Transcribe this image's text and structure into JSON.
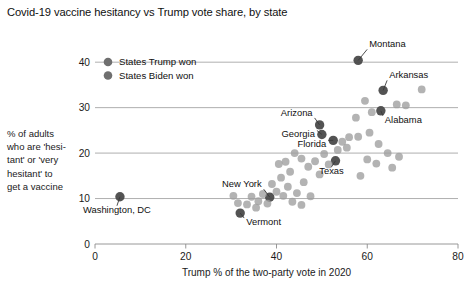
{
  "chart_data": {
    "type": "scatter",
    "title": "Covid-19 vaccine hesitancy vs Trump vote share, by state",
    "xlabel": "Trump % of the two-party vote in 2020",
    "ylabel": "% of adults who are 'hesitant' or 'very hesitant' to get a vaccine",
    "ylabel_lines": [
      "% of adults",
      "who are 'hesi-",
      "tant' or 'very",
      "hesitant' to",
      "get a vaccine"
    ],
    "xlim": [
      0,
      80
    ],
    "ylim": [
      0,
      44
    ],
    "xticks": [
      0,
      20,
      40,
      60,
      80
    ],
    "yticks": [
      0,
      10,
      20,
      30,
      40
    ],
    "xtick_labels": [
      "0",
      "20",
      "40",
      "60",
      "80"
    ],
    "ytick_labels": [
      "0",
      "10",
      "20",
      "30",
      "40"
    ],
    "grid": "horizontal",
    "legend_position": "top-left-inside",
    "colors": {
      "trump_won": "#6f6f6f",
      "biden_won": "#6f6f6f",
      "highlight": "#4a4a4a",
      "plain": "#9e9e9e",
      "gridline": "#9a9a9a",
      "text": "#101010"
    },
    "legend": [
      {
        "label": "States Trump won",
        "color": "#6f6f6f",
        "key": "trump_won"
      },
      {
        "label": "States Biden won",
        "color": "#6f6f6f",
        "key": "biden_won"
      }
    ],
    "series": [
      {
        "name": "States Trump won",
        "key": "trump_won",
        "points": [
          {
            "label": "Montana",
            "x": 58.0,
            "y": 40.4,
            "highlight": true,
            "label_dx": 11,
            "label_dy": -13,
            "anchor": "start"
          },
          {
            "label": "Arkansas",
            "x": 63.5,
            "y": 33.8,
            "highlight": true,
            "label_dx": 6,
            "label_dy": -12,
            "anchor": "start"
          },
          {
            "label": "Alabama",
            "x": 63.0,
            "y": 29.3,
            "highlight": true,
            "label_dx": 4,
            "label_dy": 12,
            "anchor": "start"
          },
          {
            "label": "Florida",
            "x": 52.5,
            "y": 22.8,
            "highlight": true,
            "label_dx": -7,
            "label_dy": 7,
            "anchor": "end"
          },
          {
            "label": "Texas",
            "x": 53.0,
            "y": 18.3,
            "highlight": true,
            "label_dx": -4,
            "label_dy": 13,
            "anchor": "middle"
          },
          {
            "label": null,
            "x": 72.0,
            "y": 34.0,
            "highlight": false
          },
          {
            "label": null,
            "x": 68.5,
            "y": 30.5,
            "highlight": false
          },
          {
            "label": null,
            "x": 66.5,
            "y": 30.7,
            "highlight": false
          },
          {
            "label": null,
            "x": 59.5,
            "y": 31.5,
            "highlight": false
          },
          {
            "label": null,
            "x": 61.0,
            "y": 29.0,
            "highlight": false
          },
          {
            "label": null,
            "x": 57.5,
            "y": 27.8,
            "highlight": false
          },
          {
            "label": null,
            "x": 60.5,
            "y": 24.5,
            "highlight": false
          },
          {
            "label": null,
            "x": 58.0,
            "y": 23.6,
            "highlight": false
          },
          {
            "label": null,
            "x": 56.0,
            "y": 23.5,
            "highlight": false
          },
          {
            "label": null,
            "x": 54.5,
            "y": 22.5,
            "highlight": false
          },
          {
            "label": null,
            "x": 55.5,
            "y": 21.2,
            "highlight": false
          },
          {
            "label": null,
            "x": 53.5,
            "y": 20.7,
            "highlight": false
          },
          {
            "label": null,
            "x": 62.5,
            "y": 22.0,
            "highlight": false
          },
          {
            "label": null,
            "x": 64.5,
            "y": 20.0,
            "highlight": false
          },
          {
            "label": null,
            "x": 67.0,
            "y": 19.2,
            "highlight": false
          },
          {
            "label": null,
            "x": 60.0,
            "y": 18.6,
            "highlight": false
          },
          {
            "label": null,
            "x": 62.0,
            "y": 17.7,
            "highlight": false
          },
          {
            "label": null,
            "x": 65.5,
            "y": 16.8,
            "highlight": false
          },
          {
            "label": null,
            "x": 58.5,
            "y": 15.0,
            "highlight": false
          },
          {
            "label": null,
            "x": 50.5,
            "y": 19.8,
            "highlight": false
          },
          {
            "label": null,
            "x": 51.5,
            "y": 17.5,
            "highlight": false
          },
          {
            "label": null,
            "x": 48.5,
            "y": 18.2,
            "highlight": false
          },
          {
            "label": null,
            "x": 47.0,
            "y": 17.0,
            "highlight": false
          },
          {
            "label": null,
            "x": 49.5,
            "y": 15.3,
            "highlight": false
          },
          {
            "label": null,
            "x": 46.0,
            "y": 13.6,
            "highlight": false
          },
          {
            "label": null,
            "x": 44.5,
            "y": 11.2,
            "highlight": false
          },
          {
            "label": null,
            "x": 47.5,
            "y": 10.5,
            "highlight": false
          },
          {
            "label": null,
            "x": 43.5,
            "y": 9.3,
            "highlight": false
          },
          {
            "label": null,
            "x": 45.5,
            "y": 8.6,
            "highlight": false
          },
          {
            "label": null,
            "x": 41.5,
            "y": 10.6,
            "highlight": false
          }
        ]
      },
      {
        "name": "States Biden won",
        "key": "biden_won",
        "points": [
          {
            "label": "Arizona",
            "x": 49.5,
            "y": 26.2,
            "highlight": true,
            "label_dx": -7,
            "label_dy": -9,
            "anchor": "end"
          },
          {
            "label": "Georgia",
            "x": 50.0,
            "y": 24.1,
            "highlight": true,
            "label_dx": -7,
            "label_dy": 3,
            "anchor": "end"
          },
          {
            "label": "New York",
            "x": 38.5,
            "y": 10.3,
            "highlight": true,
            "label_dx": -8,
            "label_dy": -10,
            "anchor": "end"
          },
          {
            "label": "Vermont",
            "x": 32.0,
            "y": 6.8,
            "highlight": true,
            "label_dx": 6,
            "label_dy": 12,
            "anchor": "start"
          },
          {
            "label": "Washington, DC",
            "x": 5.5,
            "y": 10.4,
            "highlight": true,
            "label_dx": -3,
            "label_dy": 16,
            "anchor": "middle"
          },
          {
            "label": null,
            "x": 44.0,
            "y": 20.0,
            "highlight": false
          },
          {
            "label": null,
            "x": 45.5,
            "y": 18.8,
            "highlight": false
          },
          {
            "label": null,
            "x": 42.0,
            "y": 18.1,
            "highlight": false
          },
          {
            "label": null,
            "x": 40.5,
            "y": 17.6,
            "highlight": false
          },
          {
            "label": null,
            "x": 43.0,
            "y": 15.9,
            "highlight": false
          },
          {
            "label": null,
            "x": 41.0,
            "y": 14.6,
            "highlight": false
          },
          {
            "label": null,
            "x": 39.0,
            "y": 13.2,
            "highlight": false
          },
          {
            "label": null,
            "x": 42.5,
            "y": 12.6,
            "highlight": false
          },
          {
            "label": null,
            "x": 40.0,
            "y": 11.5,
            "highlight": false
          },
          {
            "label": null,
            "x": 37.0,
            "y": 11.0,
            "highlight": false
          },
          {
            "label": null,
            "x": 38.0,
            "y": 8.9,
            "highlight": false
          },
          {
            "label": null,
            "x": 36.0,
            "y": 9.4,
            "highlight": false
          },
          {
            "label": null,
            "x": 34.5,
            "y": 10.4,
            "highlight": false
          },
          {
            "label": null,
            "x": 33.5,
            "y": 8.7,
            "highlight": false
          },
          {
            "label": null,
            "x": 35.5,
            "y": 8.0,
            "highlight": false
          },
          {
            "label": null,
            "x": 30.5,
            "y": 10.6,
            "highlight": false
          },
          {
            "label": null,
            "x": 31.5,
            "y": 9.0,
            "highlight": false
          }
        ]
      }
    ]
  }
}
